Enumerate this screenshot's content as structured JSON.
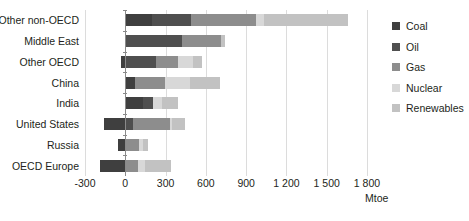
{
  "chart_data": {
    "type": "bar",
    "orientation": "horizontal",
    "stacked": true,
    "title": "",
    "xlabel": "Mtoe",
    "ylabel": "",
    "xlim": [
      -300,
      1800
    ],
    "xticks": [
      -300,
      0,
      300,
      600,
      900,
      1200,
      1500,
      1800
    ],
    "xtick_labels": [
      "-300",
      "0",
      "300",
      "600",
      "900",
      "1 200",
      "1 500",
      "1 800"
    ],
    "grid": true,
    "legend_position": "right",
    "categories": [
      "Other non-OECD",
      "Middle East",
      "Other OECD",
      "China",
      "India",
      "United States",
      "Russia",
      "OECD Europe"
    ],
    "series": [
      {
        "name": "Coal",
        "color": "#3f3f3f",
        "values": [
          200,
          0,
          -30,
          75,
          135,
          -160,
          -55,
          -190
        ]
      },
      {
        "name": "Oil",
        "color": "#4f4f4f",
        "values": [
          290,
          420,
          230,
          0,
          75,
          60,
          0,
          0
        ]
      },
      {
        "name": "Gas",
        "color": "#8d8d8d",
        "values": [
          485,
          290,
          165,
          220,
          0,
          270,
          105,
          95
        ]
      },
      {
        "name": "Nuclear",
        "color": "#d8d8d8",
        "values": [
          60,
          0,
          110,
          185,
          65,
          15,
          25,
          55
        ]
      },
      {
        "name": "Renewables",
        "color": "#c2c2c2",
        "values": [
          625,
          30,
          70,
          225,
          120,
          100,
          40,
          190
        ]
      }
    ],
    "legend": [
      "Coal",
      "Oil",
      "Gas",
      "Nuclear",
      "Renewables"
    ],
    "axis_colors": {
      "zero_line": "#8a8a8a",
      "gridline": "#dcdcdc",
      "text": "#231f20"
    }
  }
}
